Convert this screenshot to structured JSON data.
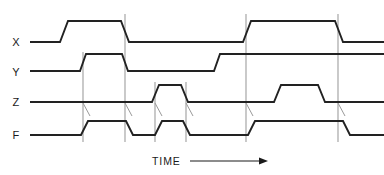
{
  "diagram": {
    "kind": "timing-diagram",
    "width": 384,
    "height": 175,
    "background_color": "#ffffff",
    "wave_color": "#222222",
    "grid_color": "#999999",
    "text_color": "#1a1a1a",
    "axis": {
      "label": "TIME",
      "arrow_direction": "right",
      "label_x": 152,
      "label_y": 165,
      "arrow_x1": 190,
      "arrow_x2": 268,
      "arrow_y": 161
    },
    "signals": [
      {
        "name": "X",
        "label": "X",
        "label_x": 16,
        "label_y": 46,
        "low_y": 42,
        "high_y": 21,
        "start_x": 30,
        "end_x": 384,
        "edge_width": 8,
        "transitions": [
          {
            "x": 60,
            "to": "high"
          },
          {
            "x": 121,
            "to": "low"
          },
          {
            "x": 243,
            "to": "high"
          },
          {
            "x": 335,
            "to": "low"
          }
        ]
      },
      {
        "name": "Y",
        "label": "Y",
        "label_x": 16,
        "label_y": 76,
        "low_y": 71,
        "high_y": 54,
        "start_x": 30,
        "end_x": 384,
        "edge_width": 6,
        "transitions": [
          {
            "x": 80,
            "to": "high"
          },
          {
            "x": 122,
            "to": "low"
          },
          {
            "x": 214,
            "to": "high"
          }
        ]
      },
      {
        "name": "Z",
        "label": "Z",
        "label_x": 16,
        "label_y": 106,
        "low_y": 102,
        "high_y": 85,
        "start_x": 30,
        "end_x": 384,
        "edge_width": 7,
        "transitions": [
          {
            "x": 152,
            "to": "high"
          },
          {
            "x": 181,
            "to": "low"
          },
          {
            "x": 274,
            "to": "high"
          },
          {
            "x": 318,
            "to": "low"
          }
        ]
      },
      {
        "name": "F",
        "label": "F",
        "label_x": 16,
        "label_y": 139,
        "low_y": 135,
        "high_y": 121,
        "start_x": 30,
        "end_x": 384,
        "edge_width": 7,
        "transitions": [
          {
            "x": 81,
            "to": "high"
          },
          {
            "x": 126,
            "to": "low"
          },
          {
            "x": 155,
            "to": "high"
          },
          {
            "x": 183,
            "to": "low"
          },
          {
            "x": 248,
            "to": "high"
          },
          {
            "x": 343,
            "to": "low"
          }
        ]
      }
    ],
    "grid_lines": [
      {
        "x": 83,
        "y1": 52,
        "y2": 142
      },
      {
        "x": 125,
        "y1": 14,
        "y2": 142
      },
      {
        "x": 155,
        "y1": 82,
        "y2": 142
      },
      {
        "x": 186,
        "y1": 82,
        "y2": 142
      },
      {
        "x": 246,
        "y1": 14,
        "y2": 142
      },
      {
        "x": 338,
        "y1": 14,
        "y2": 142
      }
    ],
    "causal_ticks": [
      {
        "x1": 83,
        "y1": 103,
        "x2": 90,
        "y2": 116
      },
      {
        "x1": 125,
        "y1": 103,
        "x2": 132,
        "y2": 116
      },
      {
        "x1": 155,
        "y1": 103,
        "x2": 162,
        "y2": 116
      },
      {
        "x1": 186,
        "y1": 103,
        "x2": 193,
        "y2": 116
      },
      {
        "x1": 246,
        "y1": 103,
        "x2": 253,
        "y2": 116
      },
      {
        "x1": 338,
        "y1": 103,
        "x2": 345,
        "y2": 116
      }
    ]
  }
}
